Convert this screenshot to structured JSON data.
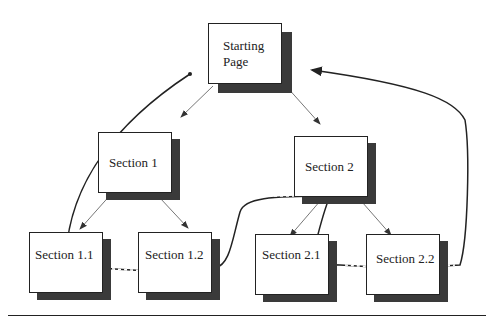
{
  "diagram": {
    "nodes": {
      "start": {
        "label_line1": "Starting",
        "label_line2": "Page"
      },
      "s1": {
        "label": "Section 1"
      },
      "s2": {
        "label": "Section 2"
      },
      "s11": {
        "label": "Section 1.1"
      },
      "s12": {
        "label": "Section 1.2"
      },
      "s21": {
        "label": "Section 2.1"
      },
      "s22": {
        "label": "Section 2.2"
      }
    },
    "edges": [
      {
        "from": "Starting Page",
        "to": "Section 1",
        "style": "thin-arrow"
      },
      {
        "from": "Starting Page",
        "to": "Section 2",
        "style": "thin-arrow"
      },
      {
        "from": "Section 1",
        "to": "Section 1.1",
        "style": "thin-arrow"
      },
      {
        "from": "Section 1",
        "to": "Section 1.2",
        "style": "thin-arrow"
      },
      {
        "from": "Section 2",
        "to": "Section 2.1",
        "style": "thin-arrow"
      },
      {
        "from": "Section 2",
        "to": "Section 2.2",
        "style": "thin-arrow"
      },
      {
        "from": "Starting Page",
        "to": "Section 1.1 / Section 1.2 / Section 2",
        "style": "bold-dashed-path"
      },
      {
        "from": "Section 2",
        "to": "Section 2.1 / Section 2.2 / Starting Page",
        "style": "bold-dashed-path-arrow"
      }
    ]
  }
}
